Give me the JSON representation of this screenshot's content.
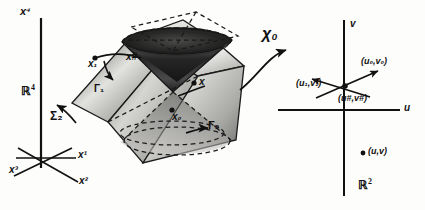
{
  "figure": {
    "type": "mathematical-diagram"
  },
  "left_panel": {
    "name": "R4 ambient space with coordinate axes",
    "space_label": "ℝ",
    "space_exponent": "4",
    "axes": [
      {
        "id": "x4",
        "base": "x",
        "exponent": "4",
        "label": "x⁴"
      },
      {
        "id": "x1",
        "base": "x",
        "exponent": "1",
        "label": "x¹"
      },
      {
        "id": "x2",
        "base": "x",
        "exponent": "2",
        "label": "x²"
      },
      {
        "id": "x3",
        "base": "x",
        "exponent": "3",
        "label": "x³"
      }
    ]
  },
  "cone_panel": {
    "name": "double light cone with intersecting hypersurface",
    "surface_label": {
      "base": "Σ",
      "subscript": "2",
      "label": "Σ₂"
    },
    "points": [
      {
        "id": "x1-point",
        "base": "x",
        "subscript": "1",
        "label": "x₁"
      },
      {
        "id": "x-sharp-point",
        "base": "x",
        "superscript": "#",
        "label": "x#"
      },
      {
        "id": "x-point",
        "base": "x",
        "label": "x"
      },
      {
        "id": "x0-point",
        "base": "x",
        "subscript": "0",
        "label": "x₀"
      }
    ],
    "curves": [
      {
        "id": "gamma1",
        "base": "Γ",
        "subscript": "1",
        "label": "Γ₁"
      },
      {
        "id": "gamma0",
        "base": "Γ",
        "subscript": "0",
        "label": "Γ₀"
      }
    ]
  },
  "map": {
    "name": "chart map arrow",
    "symbol": "χ",
    "subscript": "0",
    "label": "χ₀"
  },
  "right_panel": {
    "name": "R2 parameter plane",
    "space_label": "ℝ",
    "space_exponent": "2",
    "axes": [
      {
        "id": "v-axis",
        "label": "v"
      },
      {
        "id": "u-axis",
        "label": "u"
      }
    ],
    "points": [
      {
        "id": "u0v0",
        "label": "(u₀,v₀)"
      },
      {
        "id": "u1v1",
        "label": "(u₁,v₁)"
      },
      {
        "id": "usharp-vsharp",
        "label": "(u#,v#)"
      },
      {
        "id": "uv",
        "label": "(u,v)"
      }
    ]
  },
  "colors": {
    "ink": "#111111",
    "background": "#fdfdfc",
    "shade_dark": "#2b2b2b",
    "shade_mid": "#8a8a8a",
    "shade_light": "#d8d8d6"
  }
}
